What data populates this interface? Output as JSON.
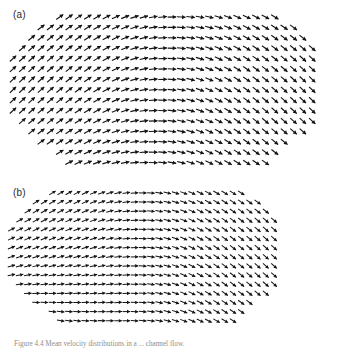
{
  "figure": {
    "caption": "Figure 4.4  Mean velocity distributions in a ... channel flow.",
    "panels": [
      {
        "id": "a",
        "label": "(a)",
        "arrow_color": "#141414"
      },
      {
        "id": "b",
        "label": "(b)",
        "arrow_color": "#141414"
      }
    ]
  },
  "chart_data": [
    {
      "type": "quiver",
      "panel": "a",
      "title": "(a)",
      "xlabel": "",
      "ylabel": "",
      "grid": false,
      "legend": false,
      "description": "Vector (quiver) field of uniform-magnitude arrows on a lens/elliptical domain. Arrows rotate smoothly from up-right (~+45 deg) at the left edge, through horizontal (0 deg) across the centre, to down-right (~-45 deg) at the right edge. Angle depends mainly on horizontal position, with a mild vertical modulation that is symmetric about the mid-height.",
      "domain": {
        "x_cols": 33,
        "y_rows": 15,
        "dx": 9.35,
        "dy": 10.4,
        "x0": 13,
        "y0": 17,
        "shape": "lens"
      },
      "arrow_length": 8.6,
      "angle_model": {
        "unit": "degrees",
        "formula": "theta = -A * tanh(k * u) * (1 - c * v * v) + s * v * (1 - u * u)",
        "A": 46,
        "k": 1.85,
        "c": 0.18,
        "s": 6,
        "u_range": [
          -1,
          1
        ],
        "v_range": [
          -1,
          1
        ],
        "note": "u = normalized horizontal position, v = normalized vertical position"
      },
      "row_extents": [
        {
          "row": 0,
          "col_start": 5,
          "col_end": 28
        },
        {
          "row": 1,
          "col_start": 3,
          "col_end": 30
        },
        {
          "row": 2,
          "col_start": 2,
          "col_end": 31
        },
        {
          "row": 3,
          "col_start": 1,
          "col_end": 32
        },
        {
          "row": 4,
          "col_start": 0,
          "col_end": 32
        },
        {
          "row": 5,
          "col_start": 0,
          "col_end": 32
        },
        {
          "row": 6,
          "col_start": 0,
          "col_end": 32
        },
        {
          "row": 7,
          "col_start": 0,
          "col_end": 32
        },
        {
          "row": 8,
          "col_start": 0,
          "col_end": 32
        },
        {
          "row": 9,
          "col_start": 0,
          "col_end": 32
        },
        {
          "row": 10,
          "col_start": 1,
          "col_end": 32
        },
        {
          "row": 11,
          "col_start": 2,
          "col_end": 31
        },
        {
          "row": 12,
          "col_start": 3,
          "col_end": 29
        },
        {
          "row": 13,
          "col_start": 5,
          "col_end": 28
        },
        {
          "row": 14,
          "col_start": 6,
          "col_end": 27
        }
      ]
    },
    {
      "type": "quiver",
      "panel": "b",
      "title": "(b)",
      "xlabel": "",
      "ylabel": "",
      "grid": false,
      "legend": false,
      "description": "Vector (quiver) field on the same lens domain. Unlike panel (a) the arrows never turn upward: at the left edge they already point down-right (~-40 deg), straighten to horizontal near the centre, and turn down-right again (~-48 deg) at the right edge. The top two rows are nearly horizontal while lower rows are increasingly inclined downward on the left, giving an asymmetric field.",
      "domain": {
        "x_cols": 33,
        "y_rows": 15,
        "dx": 9.35,
        "dy": 10.4,
        "x0": 13,
        "y0": 17,
        "shape": "lens"
      },
      "arrow_length": 8.6,
      "angle_model": {
        "unit": "degrees",
        "formula": "theta = -B * tanh(k * u) * (1 - c * v * v) - L * (1 - tanh(3 * (u + 0.35))) / 2 * (0.5 - 0.5 * v)",
        "B": 44,
        "k": 1.9,
        "c": 0.15,
        "L": 48,
        "u_range": [
          -1,
          1
        ],
        "v_range": [
          -1,
          1
        ],
        "note": "u = normalized horizontal position, v = normalized vertical position (v = +1 at top)"
      },
      "row_extents": [
        {
          "row": 0,
          "col_start": 5,
          "col_end": 28
        },
        {
          "row": 1,
          "col_start": 3,
          "col_end": 30
        },
        {
          "row": 2,
          "col_start": 2,
          "col_end": 31
        },
        {
          "row": 3,
          "col_start": 1,
          "col_end": 32
        },
        {
          "row": 4,
          "col_start": 0,
          "col_end": 32
        },
        {
          "row": 5,
          "col_start": 0,
          "col_end": 32
        },
        {
          "row": 6,
          "col_start": 0,
          "col_end": 32
        },
        {
          "row": 7,
          "col_start": 0,
          "col_end": 32
        },
        {
          "row": 8,
          "col_start": 0,
          "col_end": 32
        },
        {
          "row": 9,
          "col_start": 0,
          "col_end": 32
        },
        {
          "row": 10,
          "col_start": 1,
          "col_end": 32
        },
        {
          "row": 11,
          "col_start": 2,
          "col_end": 31
        },
        {
          "row": 12,
          "col_start": 3,
          "col_end": 29
        },
        {
          "row": 13,
          "col_start": 5,
          "col_end": 28
        },
        {
          "row": 14,
          "col_start": 6,
          "col_end": 27
        }
      ]
    }
  ]
}
